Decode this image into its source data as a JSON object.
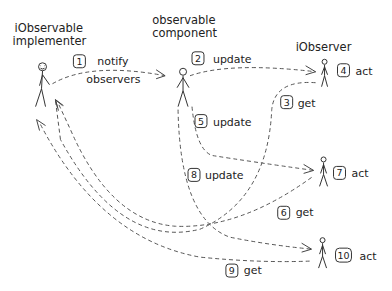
{
  "diagram": {
    "type": "sequence",
    "style": "hand-drawn",
    "actors": [
      {
        "id": "implementer",
        "title_line1": "iObservable",
        "title_line2": "implementer"
      },
      {
        "id": "component",
        "title_line1": "observable",
        "title_line2": "component"
      },
      {
        "id": "observer",
        "title_line1": "iObserver",
        "title_line2": ""
      }
    ],
    "steps": [
      {
        "num": "1",
        "label": "notify",
        "label2": "observers",
        "from": "implementer",
        "to": "component"
      },
      {
        "num": "2",
        "label": "update",
        "from": "component",
        "to": "observer-1"
      },
      {
        "num": "3",
        "label": "get",
        "from": "observer-1",
        "to": "implementer"
      },
      {
        "num": "4",
        "label": "act",
        "actor": "observer-1"
      },
      {
        "num": "5",
        "label": "update",
        "from": "component",
        "to": "observer-2"
      },
      {
        "num": "6",
        "label": "get",
        "from": "observer-2",
        "to": "implementer"
      },
      {
        "num": "7",
        "label": "act",
        "actor": "observer-2"
      },
      {
        "num": "8",
        "label": "update",
        "from": "component",
        "to": "observer-3"
      },
      {
        "num": "9",
        "label": "get",
        "from": "observer-3",
        "to": "implementer"
      },
      {
        "num": "10",
        "label": "act",
        "actor": "observer-3"
      }
    ]
  }
}
